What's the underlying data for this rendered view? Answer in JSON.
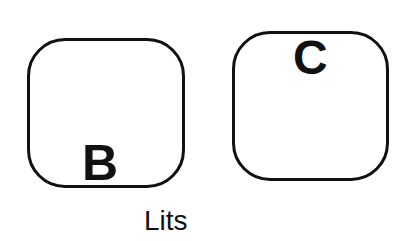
{
  "diagram": {
    "boxes": [
      {
        "id": "B",
        "label": "B"
      },
      {
        "id": "C",
        "label": "C"
      }
    ],
    "caption": "Lits"
  }
}
